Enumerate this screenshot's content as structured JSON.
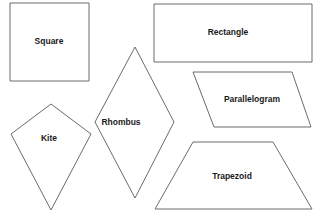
{
  "diagram": {
    "shapes": [
      {
        "id": "square",
        "label": "Square",
        "points": "10,3 89,3 89,81 10,81",
        "label_x": 49,
        "label_y": 42
      },
      {
        "id": "rectangle",
        "label": "Rectangle",
        "points": "154,4 312,4 312,62 154,62",
        "label_x": 228,
        "label_y": 33
      },
      {
        "id": "rhombus",
        "label": "Rhombus",
        "points": "135,47 174,122 135,198 95,122",
        "label_x": 121,
        "label_y": 123
      },
      {
        "id": "parallelogram",
        "label": "Parallelogram",
        "points": "193,72 292,72 311,127 214,127",
        "label_x": 252,
        "label_y": 100
      },
      {
        "id": "kite",
        "label": "Kite",
        "points": "51,104 91,134 51,210 11,134",
        "label_x": 49,
        "label_y": 139
      },
      {
        "id": "trapezoid",
        "label": "Trapezoid",
        "points": "193,142 273,142 312,209 155,209",
        "label_x": 232,
        "label_y": 177
      }
    ],
    "colors": {
      "stroke": "#6b6b6b",
      "fill": "#ffffff",
      "text": "#1a1a1a"
    }
  }
}
